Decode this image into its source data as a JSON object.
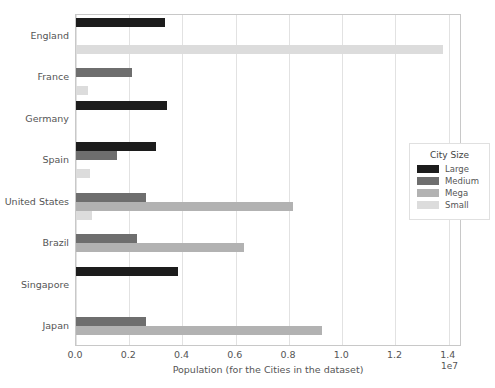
{
  "chart_data": {
    "type": "bar",
    "orientation": "horizontal",
    "title": "",
    "xlabel": "Population (for the Cities in the dataset)",
    "ylabel": "",
    "x_exponent_label": "1e7",
    "xlim": [
      0,
      14500000
    ],
    "xticks": [
      0,
      2000000,
      4000000,
      6000000,
      8000000,
      10000000,
      12000000,
      14000000
    ],
    "xticklabels": [
      "0.0",
      "0.2",
      "0.4",
      "0.6",
      "0.8",
      "1.0",
      "1.2",
      "1.4"
    ],
    "grid": true,
    "grid_axis": "x",
    "legend_title": "City Size",
    "legend_position": "center right",
    "categories": [
      "England",
      "France",
      "Germany",
      "Spain",
      "United States",
      "Brazil",
      "Singapore",
      "Japan"
    ],
    "series": [
      {
        "name": "Large",
        "color": "#1c1c1c",
        "values": [
          3350000,
          null,
          3400000,
          3020000,
          null,
          null,
          3850000,
          null
        ]
      },
      {
        "name": "Medium",
        "color": "#6e6e6e",
        "values": [
          null,
          2100000,
          null,
          1550000,
          2620000,
          2300000,
          null,
          2630000
        ]
      },
      {
        "name": "Mega",
        "color": "#b2b2b2",
        "values": [
          null,
          null,
          null,
          null,
          8150000,
          6300000,
          null,
          9250000
        ]
      },
      {
        "name": "Small",
        "color": "#dcdcdc",
        "values": [
          13800000,
          450000,
          null,
          520000,
          600000,
          null,
          null,
          null
        ]
      }
    ]
  },
  "legend": {
    "title": "City Size",
    "entries": [
      {
        "label": "Large",
        "color": "#1c1c1c"
      },
      {
        "label": "Medium",
        "color": "#6e6e6e"
      },
      {
        "label": "Mega",
        "color": "#b2b2b2"
      },
      {
        "label": "Small",
        "color": "#dcdcdc"
      }
    ]
  },
  "axes": {
    "x_label": "Population (for the Cities in the dataset)",
    "x_exponent": "1e7",
    "x_tick_labels": [
      "0.0",
      "0.2",
      "0.4",
      "0.6",
      "0.8",
      "1.0",
      "1.2",
      "1.4"
    ],
    "y_tick_labels": [
      "England",
      "France",
      "Germany",
      "Spain",
      "United States",
      "Brazil",
      "Singapore",
      "Japan"
    ]
  }
}
